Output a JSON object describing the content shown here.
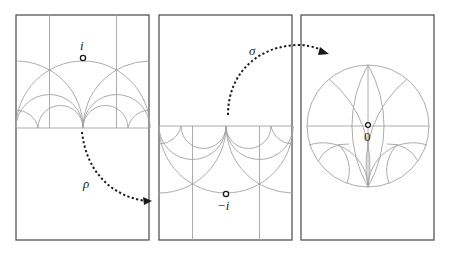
{
  "figure": {
    "panels": [
      {
        "id": "upper-half-plane",
        "point_label": "i"
      },
      {
        "id": "lower-half-plane",
        "point_label": "−i"
      },
      {
        "id": "unit-disk",
        "point_label": "0"
      }
    ],
    "maps": [
      {
        "id": "rho",
        "label": "ρ",
        "from": "upper-half-plane",
        "to": "lower-half-plane"
      },
      {
        "id": "sigma",
        "label": "σ",
        "from": "lower-half-plane",
        "to": "unit-disk"
      }
    ],
    "colors": {
      "frame": "#555555",
      "geodesics": "#a3a3a3",
      "arrows": "#1a1a1a"
    }
  }
}
